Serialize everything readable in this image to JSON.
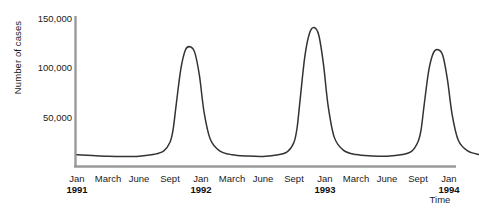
{
  "chart_data": {
    "type": "line",
    "title": "",
    "subtitle": "",
    "xlabel": "Time",
    "ylabel": "Number of cases",
    "grid": false,
    "legend": "none",
    "line_color": "#333333",
    "axis_color": "#9a9a9a",
    "ylim": [
      0,
      150000
    ],
    "yticks": [
      150000,
      100000,
      50000
    ],
    "ytick_labels": [
      "150,000",
      "100,000",
      "50,000"
    ],
    "xticks": [
      {
        "label": "Jan",
        "year": "1991"
      },
      {
        "label": "March",
        "year": ""
      },
      {
        "label": "June",
        "year": ""
      },
      {
        "label": "Sept",
        "year": ""
      },
      {
        "label": "Jan",
        "year": "1992"
      },
      {
        "label": "March",
        "year": ""
      },
      {
        "label": "June",
        "year": ""
      },
      {
        "label": "Sept",
        "year": ""
      },
      {
        "label": "Jan",
        "year": "1993"
      },
      {
        "label": "March",
        "year": ""
      },
      {
        "label": "June",
        "year": ""
      },
      {
        "label": "Sept",
        "year": ""
      },
      {
        "label": "Jan",
        "year": "1994"
      }
    ],
    "x": [
      0,
      0.5,
      1,
      1.5,
      2,
      2.5,
      2.8,
      3,
      3.1,
      3.2,
      3.35,
      3.5,
      3.65,
      3.8,
      3.95,
      4.1,
      4.3,
      4.6,
      5,
      5.5,
      6,
      6.5,
      6.8,
      7,
      7.1,
      7.2,
      7.35,
      7.5,
      7.65,
      7.8,
      7.95,
      8.1,
      8.3,
      8.6,
      9,
      9.5,
      10,
      10.5,
      10.8,
      11,
      11.1,
      11.2,
      11.35,
      11.5,
      11.65,
      11.8,
      11.95,
      12.1,
      12.3,
      12.6,
      13
    ],
    "values": [
      6000,
      5200,
      4500,
      4200,
      4500,
      6500,
      10000,
      19000,
      32000,
      58000,
      95000,
      115000,
      118000,
      112000,
      88000,
      50000,
      22000,
      10000,
      6000,
      4600,
      4200,
      6000,
      9500,
      19000,
      34000,
      64000,
      108000,
      132000,
      138000,
      130000,
      100000,
      57000,
      24000,
      10500,
      6200,
      4800,
      4400,
      6200,
      9800,
      19500,
      32000,
      58000,
      94000,
      112000,
      115000,
      109000,
      84000,
      48000,
      21000,
      10000,
      6000
    ],
    "peaks": [
      {
        "period": "Sept 1991",
        "value": 118000
      },
      {
        "period": "Sept 1992",
        "value": 138000
      },
      {
        "period": "Sept 1993",
        "value": 115000
      }
    ],
    "baseline_value": 4500
  }
}
